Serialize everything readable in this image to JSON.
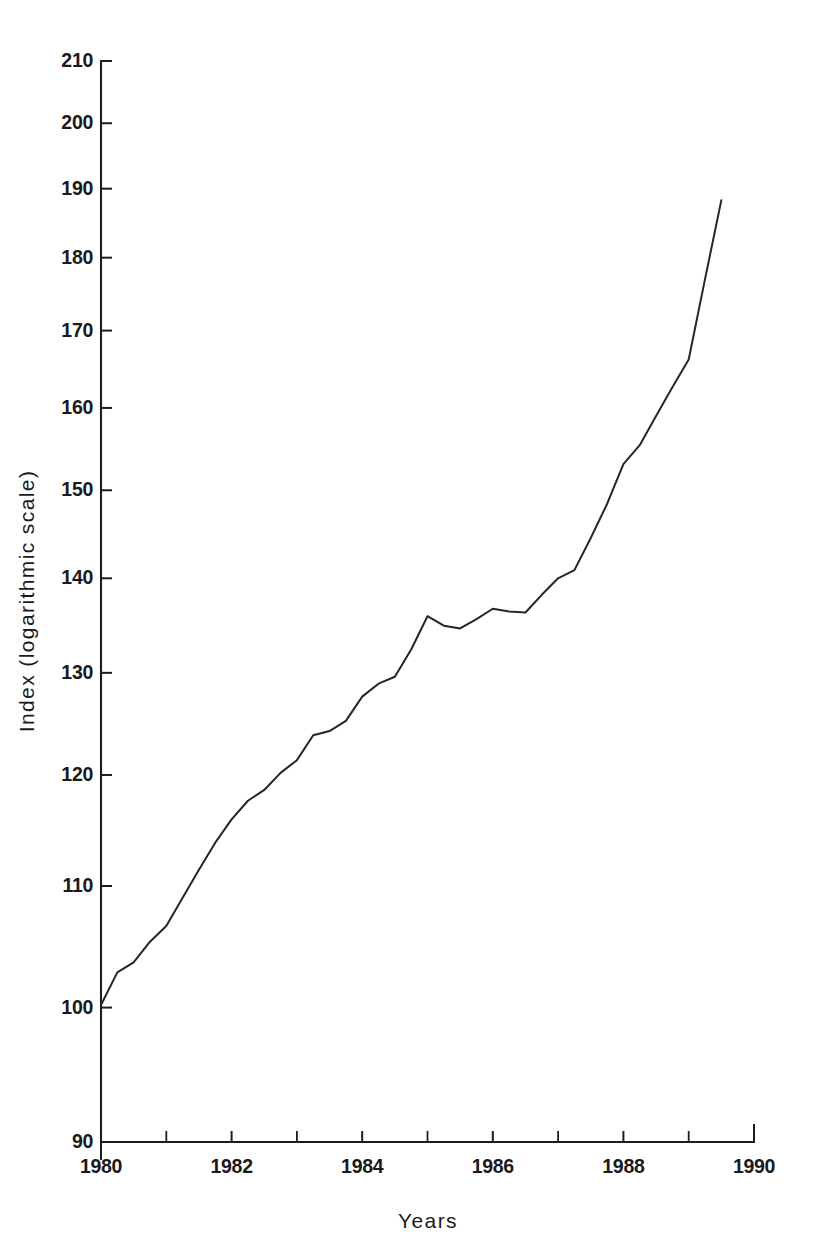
{
  "chart_data": {
    "type": "line",
    "title": "",
    "subtitle": "",
    "xlabel": "Years",
    "ylabel": "Index (logarithmic scale)",
    "yscale": "log",
    "xscale": "linear",
    "grid": false,
    "legend": false,
    "legend_position": "none",
    "xlim": [
      1980,
      1990
    ],
    "ylim": [
      90,
      210
    ],
    "x_major_ticks": [
      1980,
      1982,
      1984,
      1986,
      1988,
      1990
    ],
    "x_major_tick_labels": [
      "1980",
      "1982",
      "1984",
      "1986",
      "1988",
      "1990"
    ],
    "x_minor_ticks": [
      1981,
      1983,
      1985,
      1987,
      1989
    ],
    "y_ticks": [
      90,
      100,
      110,
      120,
      130,
      140,
      150,
      160,
      170,
      180,
      190,
      200,
      210
    ],
    "y_tick_labels": [
      "90",
      "100",
      "110",
      "120",
      "130",
      "140",
      "150",
      "160",
      "170",
      "180",
      "190",
      "200",
      "210"
    ],
    "series": [
      {
        "name": "Index",
        "color": "#262626",
        "x": [
          1980.0,
          1980.25,
          1980.5,
          1980.75,
          1981.0,
          1981.25,
          1981.5,
          1981.75,
          1982.0,
          1982.25,
          1982.5,
          1982.75,
          1983.0,
          1983.25,
          1983.5,
          1983.75,
          1984.0,
          1984.25,
          1984.5,
          1984.75,
          1985.0,
          1985.25,
          1985.5,
          1985.75,
          1986.0,
          1986.25,
          1986.5,
          1986.75,
          1987.0,
          1987.25,
          1987.5,
          1987.75,
          1988.0,
          1988.25,
          1988.5,
          1988.75,
          1989.0,
          1989.25,
          1989.5
        ],
        "values": [
          100.2,
          102.8,
          103.6,
          105.3,
          106.6,
          109.0,
          111.4,
          113.8,
          115.9,
          117.6,
          118.6,
          120.2,
          121.4,
          123.8,
          124.2,
          125.2,
          127.6,
          128.9,
          129.6,
          132.4,
          135.9,
          134.9,
          134.6,
          135.6,
          136.7,
          136.4,
          136.3,
          138.2,
          140.0,
          140.9,
          144.5,
          148.4,
          153.1,
          155.4,
          159.0,
          162.6,
          166.2,
          177.0,
          188.3
        ]
      }
    ]
  }
}
